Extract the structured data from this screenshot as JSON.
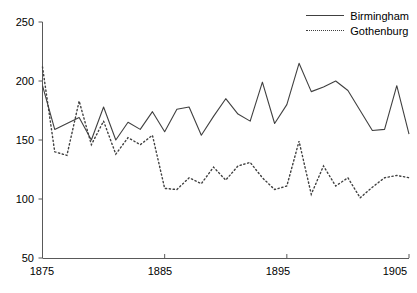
{
  "chart_data": {
    "type": "line",
    "title": "",
    "xlabel": "",
    "ylabel": "",
    "xlim": [
      1875,
      1905
    ],
    "ylim": [
      50,
      250
    ],
    "grid": false,
    "legend_position": "top-right",
    "x_ticks": [
      1875,
      1885,
      1895,
      1905
    ],
    "y_ticks": [
      50,
      100,
      150,
      200,
      250
    ],
    "x": [
      1875,
      1876,
      1877,
      1878,
      1879,
      1880,
      1881,
      1882,
      1883,
      1884,
      1885,
      1886,
      1887,
      1888,
      1889,
      1890,
      1891,
      1892,
      1893,
      1894,
      1895,
      1896,
      1897,
      1898,
      1899,
      1900,
      1901,
      1902,
      1903,
      1904,
      1905
    ],
    "series": [
      {
        "name": "Birmingham",
        "style": "solid",
        "color": "#404040",
        "values": [
          196,
          159,
          164,
          169,
          150,
          178,
          150,
          165,
          159,
          174,
          157,
          176,
          178,
          154,
          170,
          185,
          172,
          166,
          199,
          164,
          180,
          215,
          191,
          195,
          200,
          192,
          175,
          158,
          159,
          196,
          155
        ]
      },
      {
        "name": "Gothenburg",
        "style": "dotted",
        "color": "#404040",
        "values": [
          212,
          140,
          137,
          183,
          146,
          166,
          138,
          152,
          146,
          154,
          109,
          108,
          118,
          113,
          127,
          116,
          128,
          131,
          118,
          108,
          111,
          149,
          104,
          128,
          111,
          118,
          101,
          110,
          118,
          120,
          118
        ]
      }
    ]
  },
  "legend": {
    "items": [
      {
        "label": "Birmingham",
        "style": "solid"
      },
      {
        "label": "Gothenburg",
        "style": "dotted"
      }
    ]
  },
  "axes": {
    "y_tick_labels": [
      "250",
      "200",
      "150",
      "100",
      "50"
    ],
    "x_tick_labels": [
      "1875",
      "1885",
      "1895",
      "1905"
    ]
  }
}
